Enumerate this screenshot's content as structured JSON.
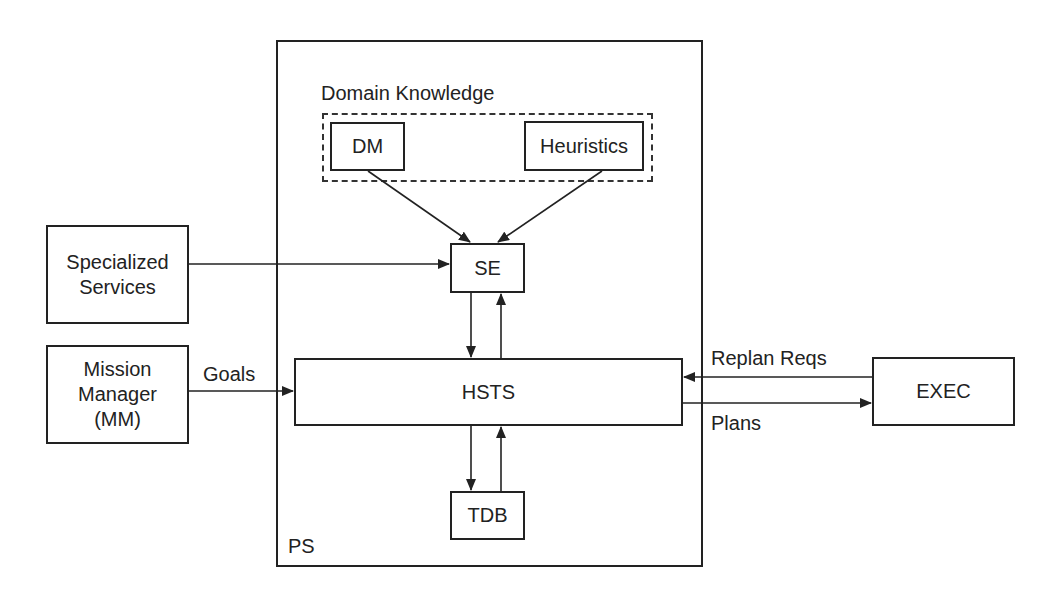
{
  "diagram": {
    "container": {
      "label": "PS"
    },
    "group": {
      "label": "Domain Knowledge"
    },
    "nodes": {
      "dm": "DM",
      "heuristics": "Heuristics",
      "se": "SE",
      "hsts": "HSTS",
      "tdb": "TDB",
      "specialized_services": "Specialized\nServices",
      "mission_manager": "Mission\nManager\n(MM)",
      "exec": "EXEC"
    },
    "edges": [
      {
        "from": "DM",
        "to": "SE",
        "label": ""
      },
      {
        "from": "Heuristics",
        "to": "SE",
        "label": ""
      },
      {
        "from": "Specialized Services",
        "to": "SE",
        "label": ""
      },
      {
        "from": "SE",
        "to": "HSTS",
        "label": ""
      },
      {
        "from": "HSTS",
        "to": "SE",
        "label": ""
      },
      {
        "from": "HSTS",
        "to": "TDB",
        "label": ""
      },
      {
        "from": "TDB",
        "to": "HSTS",
        "label": ""
      },
      {
        "from": "Mission Manager (MM)",
        "to": "HSTS",
        "label": "Goals"
      },
      {
        "from": "EXEC",
        "to": "HSTS",
        "label": "Replan Reqs"
      },
      {
        "from": "HSTS",
        "to": "EXEC",
        "label": "Plans"
      }
    ],
    "edge_labels": {
      "goals": "Goals",
      "replan": "Replan Reqs",
      "plans": "Plans"
    },
    "colors": {
      "stroke": "#222222",
      "background": "#ffffff"
    }
  }
}
